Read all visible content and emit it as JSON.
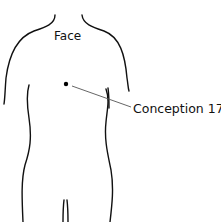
{
  "figure": {
    "region_label": "Face",
    "point_label": "Conception 17",
    "colors": {
      "outline": "#111111",
      "leader": "#555555",
      "background": "#ffffff"
    }
  }
}
